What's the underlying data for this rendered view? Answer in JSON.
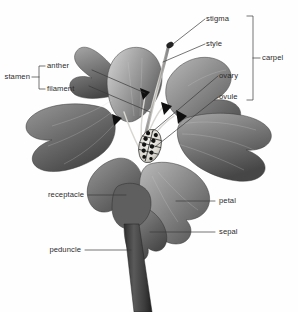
{
  "figure": {
    "background_color": "#fefefe",
    "text_color": "#2b2b2b",
    "leader_color": "#3a3a3a"
  },
  "labels": {
    "stigma": "stigma",
    "style": "style",
    "ovary": "ovary",
    "ovule": "ovule",
    "carpel": "carpel",
    "stamen": "stamen",
    "anther": "anther",
    "filament": "filament",
    "receptacle": "receptacle",
    "peduncle": "peduncle",
    "petal": "petal",
    "sepal": "sepal"
  },
  "groups": {
    "carpel_members": [
      "stigma",
      "style",
      "ovary",
      "ovule"
    ],
    "stamen_members": [
      "anther",
      "filament"
    ]
  },
  "parts": {
    "stigma": {
      "shape": "knob",
      "color": "#2a2a2a"
    },
    "style": {
      "shape": "curved-stalk",
      "color": "#cfcfcf"
    },
    "ovary": {
      "shape": "oval",
      "color": "#e6e4df"
    },
    "ovule": {
      "shape": "grid-dots",
      "color": "#141414",
      "count": 12
    },
    "anther": {
      "shape": "arrow-head",
      "color": "#111111",
      "count": 3
    },
    "petal": {
      "color": "#7d7d7d"
    },
    "sepal": {
      "color": "#6e6e6e"
    },
    "receptacle": {
      "color": "#5f5f5f"
    },
    "peduncle": {
      "color": "#3f3f3f"
    }
  }
}
